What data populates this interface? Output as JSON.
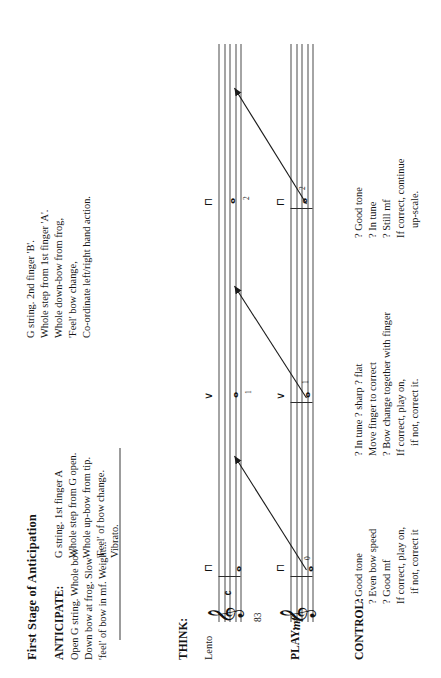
{
  "page": {
    "title": "First Stage of Anticipation",
    "page_number": "83",
    "tempo_marking": "Lento"
  },
  "sections": {
    "anticipate": {
      "label": "ANTICIPATE:",
      "lines": [
        "Open G string. Whole bow",
        "Down bow at frog. Slow",
        "'feel' of bow in mf. Weight..."
      ],
      "dynamic_inline": "mf"
    },
    "think": {
      "label": "THINK:"
    },
    "play": {
      "label": "PLAY:",
      "dynamic": "mf"
    },
    "control": {
      "label": "CONTROL:"
    }
  },
  "think_notes": [
    {
      "id": "note-a",
      "lines": [
        "G string. 1st finger A",
        "Whole step from G open.",
        "Whole up-bow from tip.",
        "'Feel' of bow change.",
        "Vibrato."
      ]
    },
    {
      "id": "note-b",
      "lines": [
        "G string. 2nd finger 'B'.",
        "Whole step from 1st finger 'A'.",
        "Whole down-bow from frog,",
        "'Feel' bow change,",
        "Co-ordinate left/right hand action."
      ]
    }
  ],
  "control_blocks": [
    {
      "id": "control-open-g",
      "label": "CONTROL:",
      "lines": [
        "? Good tone",
        "? Even bow speed",
        "? Good mf",
        "If correct, play on,",
        "if not, correct it"
      ]
    },
    {
      "id": "control-first-finger",
      "label": "",
      "lines": [
        "? In tune ? sharp ? flat",
        "Move finger to correct",
        "? Bow change together with finger",
        "If correct, play on,",
        "if not, correct it."
      ]
    },
    {
      "id": "control-second-finger",
      "label": "",
      "lines": [
        "? Good tone",
        "? In tune",
        "? Still mf",
        "If correct, continue",
        "up-scale."
      ]
    }
  ],
  "notation": {
    "staff_think": {
      "clef": "treble-clef",
      "timesig": "common-time",
      "notes": [
        {
          "name": "G",
          "fingering": "",
          "bow": "down-bow"
        },
        {
          "name": "A",
          "fingering": "1",
          "bow": "up-bow"
        },
        {
          "name": "B",
          "fingering": "2",
          "bow": "down-bow"
        }
      ]
    },
    "staff_play": {
      "clef": "treble-clef",
      "dynamic": "mf",
      "notes": [
        {
          "name": "G",
          "fingering": "0",
          "bow": "down-bow"
        },
        {
          "name": "A",
          "fingering": "1",
          "bow": "up-bow"
        },
        {
          "name": "B",
          "fingering": "2",
          "bow": "down-bow"
        }
      ]
    }
  },
  "glyphs": {
    "treble_clef": "𝄞",
    "whole_note": "𝅝",
    "common_time": "𝄴",
    "down_bow": "⊓",
    "up_bow": "∨"
  },
  "colors": {
    "ink": "#141414",
    "staff_line": "#4a4a4a",
    "rule": "#3a3a3a",
    "paper": "#ffffff"
  }
}
